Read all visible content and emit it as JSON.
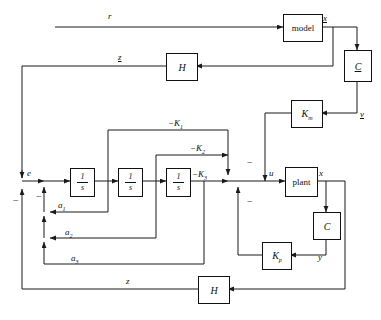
{
  "diagram": {
    "stroke_color": "#1a1a1a",
    "background": "#ffffff",
    "blocks": [
      {
        "id": "model",
        "label": "model",
        "style": "roman"
      },
      {
        "id": "c_top",
        "label": "C",
        "style": "italic-underline"
      },
      {
        "id": "h_top",
        "label": "H",
        "style": "italic"
      },
      {
        "id": "km",
        "label": "K",
        "sub": "m",
        "style": "italic"
      },
      {
        "id": "int1",
        "num": "1",
        "den": "s",
        "style": "fraction"
      },
      {
        "id": "int2",
        "num": "1",
        "den": "s",
        "style": "fraction"
      },
      {
        "id": "int3",
        "num": "1",
        "den": "s",
        "style": "fraction"
      },
      {
        "id": "plant",
        "label": "plant",
        "style": "roman"
      },
      {
        "id": "c_bot",
        "label": "C",
        "style": "italic"
      },
      {
        "id": "kp",
        "label": "K",
        "sub": "p",
        "style": "italic"
      },
      {
        "id": "h_bot",
        "label": "H",
        "style": "italic"
      }
    ],
    "signals": [
      {
        "id": "r",
        "label": "r",
        "underlined": false
      },
      {
        "id": "x_model",
        "label": "x",
        "underlined": true
      },
      {
        "id": "z_model",
        "label": "z",
        "underlined": true
      },
      {
        "id": "v",
        "label": "v",
        "underlined": true
      },
      {
        "id": "e",
        "label": "e",
        "underlined": false
      },
      {
        "id": "u",
        "label": "u",
        "underlined": false
      },
      {
        "id": "x_plant",
        "label": "x",
        "underlined": false
      },
      {
        "id": "y",
        "label": "y",
        "underlined": false
      },
      {
        "id": "z",
        "label": "z",
        "underlined": false
      }
    ],
    "gains": [
      {
        "id": "k1",
        "sign": "−",
        "base": "K",
        "sub": "1"
      },
      {
        "id": "k2",
        "sign": "−",
        "base": "K",
        "sub": "2"
      },
      {
        "id": "k3",
        "sign": "−",
        "base": "K",
        "sub": "3"
      }
    ],
    "feedback_coeffs": [
      {
        "id": "a1",
        "base": "a",
        "sub": "1"
      },
      {
        "id": "a2",
        "base": "a",
        "sub": "2"
      },
      {
        "id": "a3",
        "base": "a",
        "sub": "3"
      }
    ],
    "sum_signs": [
      {
        "id": "sum-e-minus",
        "symbol": "−"
      },
      {
        "id": "sum-a-minus",
        "symbol": "−"
      },
      {
        "id": "sum-u-minus-top",
        "symbol": "−"
      },
      {
        "id": "sum-u-minus-bot",
        "symbol": "−"
      }
    ]
  }
}
